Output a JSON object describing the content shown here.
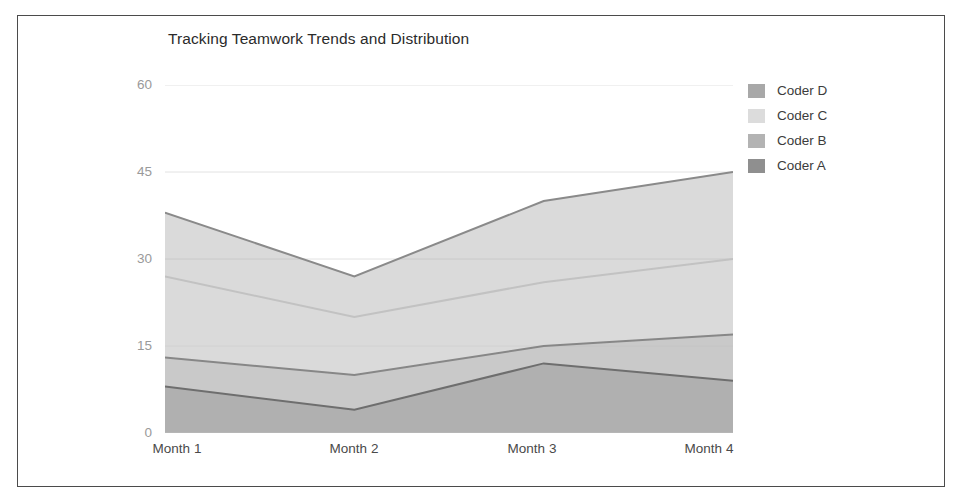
{
  "chart_data": {
    "type": "area",
    "stacked": true,
    "title": "Tracking Teamwork Trends and Distribution",
    "xlabel": "",
    "ylabel": "",
    "categories": [
      "Month 1",
      "Month 2",
      "Month 3",
      "Month 4"
    ],
    "yticks": [
      0,
      15,
      30,
      45,
      60
    ],
    "ylim": [
      0,
      60
    ],
    "grid": true,
    "legend_position": "right",
    "legend_order": [
      "Coder D",
      "Coder C",
      "Coder B",
      "Coder A"
    ],
    "series": [
      {
        "name": "Coder A",
        "color": "#8f8f8f",
        "line_color": "#6e6e6e",
        "values": [
          8,
          4,
          12,
          9
        ],
        "cumulative": [
          8,
          4,
          12,
          9
        ]
      },
      {
        "name": "Coder B",
        "color": "#b3b3b3",
        "line_color": "#878787",
        "values": [
          5,
          6,
          3,
          8
        ],
        "cumulative": [
          13,
          10,
          15,
          17
        ]
      },
      {
        "name": "Coder C",
        "color": "#dcdcdc",
        "line_color": "#c2c2c2",
        "values": [
          14,
          10,
          11,
          13
        ],
        "cumulative": [
          27,
          20,
          26,
          30
        ]
      },
      {
        "name": "Coder D",
        "color": "#a8a8a8",
        "line_color": "#8a8a8a",
        "values": [
          11,
          7,
          14,
          15
        ],
        "cumulative": [
          38,
          27,
          40,
          45
        ]
      }
    ]
  },
  "axis": {
    "ytick_labels": [
      "60",
      "45",
      "30",
      "15",
      "0"
    ],
    "xtick_labels": [
      "Month 1",
      "Month 2",
      "Month 3",
      "Month 4"
    ]
  },
  "legend": {
    "items": [
      {
        "label": "Coder D",
        "color": "#a8a8a8"
      },
      {
        "label": "Coder C",
        "color": "#dcdcdc"
      },
      {
        "label": "Coder B",
        "color": "#b3b3b3"
      },
      {
        "label": "Coder A",
        "color": "#8f8f8f"
      }
    ]
  },
  "colors": {
    "frame": "#4b4b4b",
    "grid": "#e2e2e2",
    "axis_text": "#9a9a9a",
    "title_text": "#2b2b2b",
    "background": "#ffffff"
  }
}
